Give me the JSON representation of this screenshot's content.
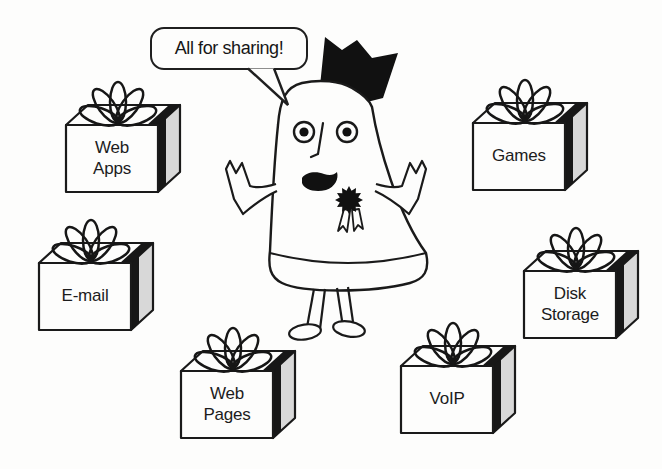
{
  "illustration": {
    "speech_bubble": {
      "text": "All for sharing!"
    },
    "character": {
      "name": "crowned-mascot"
    },
    "gifts": [
      {
        "id": "web-apps",
        "label_lines": [
          "Web",
          "Apps"
        ]
      },
      {
        "id": "e-mail",
        "label_lines": [
          "E-mail"
        ]
      },
      {
        "id": "web-pages",
        "label_lines": [
          "Web",
          "Pages"
        ]
      },
      {
        "id": "voip",
        "label_lines": [
          "VoIP"
        ]
      },
      {
        "id": "disk-storage",
        "label_lines": [
          "Disk",
          "Storage"
        ]
      },
      {
        "id": "games",
        "label_lines": [
          "Games"
        ]
      }
    ],
    "colors": {
      "ink": "#1a1a1a",
      "paper": "#fdfdfc",
      "box_side": "#d8d8d8",
      "ribbon": "#171717"
    }
  }
}
